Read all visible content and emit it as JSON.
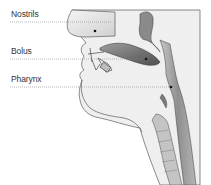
{
  "diagram": {
    "labels": [
      {
        "id": "nostrils",
        "text": "Nostrils",
        "x": 11,
        "y": 7,
        "line_y": 22,
        "dot": [
          95,
          31
        ]
      },
      {
        "id": "bolus",
        "text": "Bolus",
        "x": 11,
        "y": 45,
        "line_y": 59,
        "dot": [
          146,
          59
        ]
      },
      {
        "id": "pharynx",
        "text": "Pharynx",
        "x": 11,
        "y": 73,
        "line_y": 87,
        "dot": [
          171,
          87
        ]
      }
    ],
    "colors": {
      "outline": "#555555",
      "head_fill": "#eeeeee",
      "tissue_dark": "#6a6a6a",
      "tissue_mid": "#9a9a9a",
      "leader_line": "#888888",
      "text": "#333333",
      "background": "#ffffff"
    }
  }
}
